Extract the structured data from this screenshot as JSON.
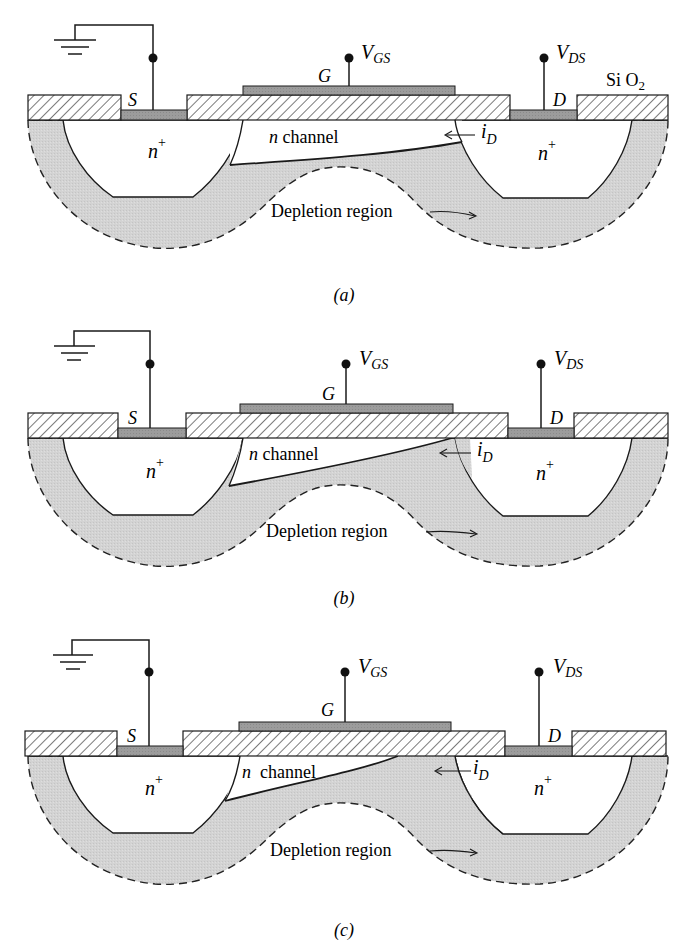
{
  "figure": {
    "colors": {
      "background": "#ffffff",
      "depletion_fill": "#d2d2d2",
      "metal_fill": "#9a9a9a",
      "line": "#1a1a1a",
      "hatch": "#333333"
    },
    "panels": [
      {
        "id": "a",
        "caption": "(a)",
        "labels": {
          "source": "S",
          "gate": "G",
          "drain": "D",
          "vgs_main": "V",
          "vgs_sub": "GS",
          "vds_main": "V",
          "vds_sub": "DS",
          "oxide_main": "Si O",
          "oxide_sub": "2",
          "n_plus_left_main": "n",
          "n_plus_left_sup": "+",
          "n_plus_right_main": "n",
          "n_plus_right_sup": "+",
          "channel_italic": "n",
          "channel_text": " channel",
          "id_main": "i",
          "id_sub": "D",
          "depletion": "Depletion region"
        }
      },
      {
        "id": "b",
        "caption": "(b)",
        "labels": {
          "source": "S",
          "gate": "G",
          "drain": "D",
          "vgs_main": "V",
          "vgs_sub": "GS",
          "vds_main": "V",
          "vds_sub": "DS",
          "n_plus_left_main": "n",
          "n_plus_left_sup": "+",
          "n_plus_right_main": "n",
          "n_plus_right_sup": "+",
          "channel_italic": "n",
          "channel_text": " channel",
          "id_main": "i",
          "id_sub": "D",
          "depletion": "Depletion region"
        }
      },
      {
        "id": "c",
        "caption": "(c)",
        "labels": {
          "source": "S",
          "gate": "G",
          "drain": "D",
          "vgs_main": "V",
          "vgs_sub": "GS",
          "vds_main": "V",
          "vds_sub": "DS",
          "n_plus_left_main": "n",
          "n_plus_left_sup": "+",
          "n_plus_right_main": "n",
          "n_plus_right_sup": "+",
          "channel_italic": "n",
          "channel_text": "  channel",
          "id_main": "i",
          "id_sub": "D",
          "depletion": "Depletion region"
        }
      }
    ]
  }
}
